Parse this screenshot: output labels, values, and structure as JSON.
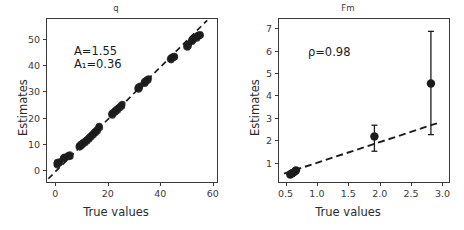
{
  "figure": {
    "width": 464,
    "height": 230,
    "background": "#ffffff",
    "marker_color": "#1c1c1c",
    "line_color": "#1c1c1c",
    "axis_color": "#3a3a3a"
  },
  "panels": [
    {
      "id": "q",
      "title": "q",
      "xlabel": "True values",
      "ylabel": "Estimates",
      "annotations": [
        {
          "text": "A=1.55",
          "value": 1.55,
          "symbol": "A"
        },
        {
          "text": "A₁=0.36",
          "value": 0.36,
          "symbol": "A₁"
        }
      ],
      "xticks": [
        0,
        20,
        40,
        60
      ],
      "xtick_labels": [
        "0",
        "20",
        "40",
        "60"
      ],
      "yticks": [
        0,
        10,
        20,
        30,
        40,
        50
      ],
      "ytick_labels": [
        "0",
        "10",
        "20",
        "30",
        "40",
        "50"
      ],
      "xlim": [
        -3.5,
        62.0
      ],
      "ylim": [
        -5.0,
        58.0
      ]
    },
    {
      "id": "Fm",
      "title": "Fm",
      "xlabel": "True values",
      "ylabel": "Estimates",
      "annotations": [
        {
          "text": "ρ=0.98",
          "value": 0.98,
          "symbol": "ρ"
        }
      ],
      "xticks": [
        0.5,
        1.0,
        1.5,
        2.0,
        2.5,
        3.0
      ],
      "xtick_labels": [
        "0.5",
        "1.0",
        "1.5",
        "2.0",
        "2.5",
        "3.0"
      ],
      "yticks": [
        1,
        2,
        3,
        4,
        5,
        6,
        7
      ],
      "ytick_labels": [
        "1",
        "2",
        "3",
        "4",
        "5",
        "6",
        "7"
      ],
      "xlim": [
        0.38,
        3.12
      ],
      "ylim": [
        0.1,
        7.45
      ]
    }
  ],
  "chart_data": [
    {
      "type": "scatter",
      "panel": "q",
      "title": "q",
      "xlabel": "True values",
      "ylabel": "Estimates",
      "xlim": [
        -3.5,
        62.0
      ],
      "ylim": [
        -5.0,
        58.0
      ],
      "grid": false,
      "legend": null,
      "annotations": [
        "A=1.55",
        "A₁=0.36"
      ],
      "reference_line": {
        "style": "dashed",
        "label": "identity",
        "slope": 1.0,
        "intercept": 0.0,
        "x_start": -3.0,
        "x_end": 57.5
      },
      "points": [
        {
          "x": 0.2,
          "y": 2.6
        },
        {
          "x": 0.3,
          "y": 3.1
        },
        {
          "x": 0.4,
          "y": 2.2
        },
        {
          "x": 0.5,
          "y": 3.4
        },
        {
          "x": 0.6,
          "y": 2.8
        },
        {
          "x": 0.8,
          "y": 3.0
        },
        {
          "x": 1.0,
          "y": 3.3
        },
        {
          "x": 1.2,
          "y": 2.9
        },
        {
          "x": 1.4,
          "y": 3.6
        },
        {
          "x": 2.6,
          "y": 4.6
        },
        {
          "x": 2.8,
          "y": 5.1
        },
        {
          "x": 3.0,
          "y": 4.9
        },
        {
          "x": 3.2,
          "y": 5.4
        },
        {
          "x": 3.4,
          "y": 4.7
        },
        {
          "x": 3.6,
          "y": 5.2
        },
        {
          "x": 4.4,
          "y": 5.6
        },
        {
          "x": 4.6,
          "y": 6.0
        },
        {
          "x": 4.8,
          "y": 5.3
        },
        {
          "x": 5.0,
          "y": 5.8
        },
        {
          "x": 5.2,
          "y": 6.2
        },
        {
          "x": 5.4,
          "y": 5.5
        },
        {
          "x": 8.6,
          "y": 9.2
        },
        {
          "x": 8.8,
          "y": 9.7
        },
        {
          "x": 9.0,
          "y": 9.0
        },
        {
          "x": 9.2,
          "y": 9.9
        },
        {
          "x": 9.4,
          "y": 10.3
        },
        {
          "x": 9.6,
          "y": 9.5
        },
        {
          "x": 10.0,
          "y": 10.6
        },
        {
          "x": 10.2,
          "y": 10.1
        },
        {
          "x": 10.4,
          "y": 10.9
        },
        {
          "x": 10.8,
          "y": 11.2
        },
        {
          "x": 11.0,
          "y": 10.7
        },
        {
          "x": 11.2,
          "y": 11.5
        },
        {
          "x": 11.6,
          "y": 11.9
        },
        {
          "x": 11.8,
          "y": 11.3
        },
        {
          "x": 12.0,
          "y": 12.2
        },
        {
          "x": 12.4,
          "y": 12.6
        },
        {
          "x": 12.6,
          "y": 12.1
        },
        {
          "x": 12.8,
          "y": 13.0
        },
        {
          "x": 13.2,
          "y": 13.4
        },
        {
          "x": 13.4,
          "y": 12.9
        },
        {
          "x": 13.6,
          "y": 13.8
        },
        {
          "x": 14.0,
          "y": 14.2
        },
        {
          "x": 14.2,
          "y": 13.7
        },
        {
          "x": 14.4,
          "y": 14.6
        },
        {
          "x": 14.8,
          "y": 15.0
        },
        {
          "x": 15.0,
          "y": 14.5
        },
        {
          "x": 15.2,
          "y": 15.4
        },
        {
          "x": 15.6,
          "y": 15.8
        },
        {
          "x": 15.8,
          "y": 15.2
        },
        {
          "x": 16.0,
          "y": 16.2
        },
        {
          "x": 16.2,
          "y": 16.8
        },
        {
          "x": 16.4,
          "y": 17.1
        },
        {
          "x": 16.6,
          "y": 16.5
        },
        {
          "x": 21.0,
          "y": 21.5
        },
        {
          "x": 21.2,
          "y": 22.0
        },
        {
          "x": 21.4,
          "y": 21.2
        },
        {
          "x": 21.6,
          "y": 22.3
        },
        {
          "x": 21.8,
          "y": 21.8
        },
        {
          "x": 22.0,
          "y": 22.6
        },
        {
          "x": 22.4,
          "y": 23.0
        },
        {
          "x": 22.6,
          "y": 22.4
        },
        {
          "x": 22.8,
          "y": 23.3
        },
        {
          "x": 23.2,
          "y": 23.7
        },
        {
          "x": 23.4,
          "y": 23.1
        },
        {
          "x": 23.6,
          "y": 24.0
        },
        {
          "x": 24.0,
          "y": 24.4
        },
        {
          "x": 24.2,
          "y": 23.9
        },
        {
          "x": 24.4,
          "y": 24.7
        },
        {
          "x": 24.8,
          "y": 25.1
        },
        {
          "x": 25.0,
          "y": 24.6
        },
        {
          "x": 25.2,
          "y": 25.5
        },
        {
          "x": 31.0,
          "y": 31.4
        },
        {
          "x": 31.2,
          "y": 31.9
        },
        {
          "x": 31.4,
          "y": 31.1
        },
        {
          "x": 31.6,
          "y": 32.2
        },
        {
          "x": 31.8,
          "y": 31.7
        },
        {
          "x": 32.0,
          "y": 32.5
        },
        {
          "x": 33.4,
          "y": 33.6
        },
        {
          "x": 33.6,
          "y": 34.1
        },
        {
          "x": 33.8,
          "y": 33.3
        },
        {
          "x": 34.0,
          "y": 34.4
        },
        {
          "x": 34.2,
          "y": 33.9
        },
        {
          "x": 34.4,
          "y": 34.7
        },
        {
          "x": 34.8,
          "y": 35.0
        },
        {
          "x": 35.0,
          "y": 34.5
        },
        {
          "x": 35.2,
          "y": 35.3
        },
        {
          "x": 43.4,
          "y": 42.6
        },
        {
          "x": 43.6,
          "y": 43.1
        },
        {
          "x": 43.8,
          "y": 42.3
        },
        {
          "x": 44.0,
          "y": 43.4
        },
        {
          "x": 44.2,
          "y": 42.9
        },
        {
          "x": 44.4,
          "y": 43.7
        },
        {
          "x": 44.8,
          "y": 43.2
        },
        {
          "x": 45.0,
          "y": 43.9
        },
        {
          "x": 45.2,
          "y": 43.5
        },
        {
          "x": 49.6,
          "y": 47.4
        },
        {
          "x": 49.8,
          "y": 48.0
        },
        {
          "x": 50.0,
          "y": 47.1
        },
        {
          "x": 50.2,
          "y": 48.3
        },
        {
          "x": 50.4,
          "y": 47.7
        },
        {
          "x": 50.6,
          "y": 48.6
        },
        {
          "x": 51.4,
          "y": 49.6
        },
        {
          "x": 51.6,
          "y": 50.1
        },
        {
          "x": 51.8,
          "y": 49.3
        },
        {
          "x": 52.0,
          "y": 50.4
        },
        {
          "x": 52.2,
          "y": 49.9
        },
        {
          "x": 52.4,
          "y": 50.7
        },
        {
          "x": 53.2,
          "y": 50.9
        },
        {
          "x": 53.4,
          "y": 51.4
        },
        {
          "x": 53.6,
          "y": 50.6
        },
        {
          "x": 53.8,
          "y": 51.7
        },
        {
          "x": 54.0,
          "y": 51.2
        },
        {
          "x": 54.2,
          "y": 52.0
        },
        {
          "x": 54.6,
          "y": 51.5
        },
        {
          "x": 54.8,
          "y": 52.2
        },
        {
          "x": 55.0,
          "y": 51.8
        }
      ]
    },
    {
      "type": "scatter",
      "panel": "Fm",
      "title": "Fm",
      "xlabel": "True values",
      "ylabel": "Estimates",
      "xlim": [
        0.38,
        3.12
      ],
      "ylim": [
        0.1,
        7.45
      ],
      "grid": false,
      "legend": null,
      "annotations": [
        "ρ=0.98"
      ],
      "reference_line": {
        "style": "dashed",
        "label": "fit",
        "slope": 0.92,
        "intercept": 0.14,
        "x_start": 0.46,
        "x_end": 2.92
      },
      "errorbar_points": [
        {
          "x": 0.56,
          "y": 0.52,
          "yerr_low": 0.45,
          "yerr_high": 0.6
        },
        {
          "x": 0.59,
          "y": 0.58,
          "yerr_low": 0.5,
          "yerr_high": 0.66
        },
        {
          "x": 0.62,
          "y": 0.63,
          "yerr_low": 0.55,
          "yerr_high": 0.72
        },
        {
          "x": 0.65,
          "y": 0.7,
          "yerr_low": 0.61,
          "yerr_high": 0.8
        },
        {
          "x": 1.9,
          "y": 2.22,
          "yerr_low": 1.56,
          "yerr_high": 2.72
        },
        {
          "x": 2.8,
          "y": 4.58,
          "yerr_low": 2.3,
          "yerr_high": 6.9
        }
      ]
    }
  ]
}
